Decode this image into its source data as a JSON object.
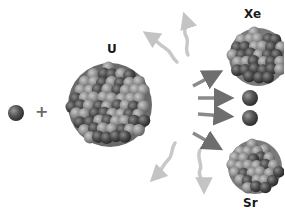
{
  "diagram": {
    "labels": {
      "uranium": "U",
      "xenon": "Xe",
      "strontium": "Sr",
      "plus": "+"
    },
    "elements": [
      {
        "id": "incoming-neutron",
        "type": "neutron",
        "cx": 16,
        "cy": 113,
        "r": 8
      },
      {
        "id": "uranium-nucleus",
        "type": "nucleus",
        "label": "U",
        "cx": 110,
        "cy": 105,
        "r": 42
      },
      {
        "id": "xenon-nucleus",
        "type": "nucleus",
        "label": "Xe",
        "cx": 258,
        "cy": 57,
        "r": 30
      },
      {
        "id": "released-neutron-1",
        "type": "neutron",
        "cx": 250,
        "cy": 98,
        "r": 8
      },
      {
        "id": "released-neutron-2",
        "type": "neutron",
        "cx": 250,
        "cy": 118,
        "r": 8
      },
      {
        "id": "strontium-nucleus",
        "type": "nucleus",
        "label": "Sr",
        "cx": 255,
        "cy": 167,
        "r": 28
      }
    ],
    "arrows": {
      "products": [
        "to-xenon",
        "to-neutron-1",
        "to-neutron-2",
        "to-strontium"
      ],
      "energy": [
        "up-left",
        "up",
        "down-left",
        "down"
      ]
    },
    "colors": {
      "background": "#ffffff",
      "nucleon_dark": "#3e3e3e",
      "nucleon_light": "#8a8a8a",
      "product_arrow": "#7a7a7a",
      "energy_arrow": "#c8c8c8",
      "label": "#1a1a1a",
      "plus": "#6a6a6a"
    }
  }
}
